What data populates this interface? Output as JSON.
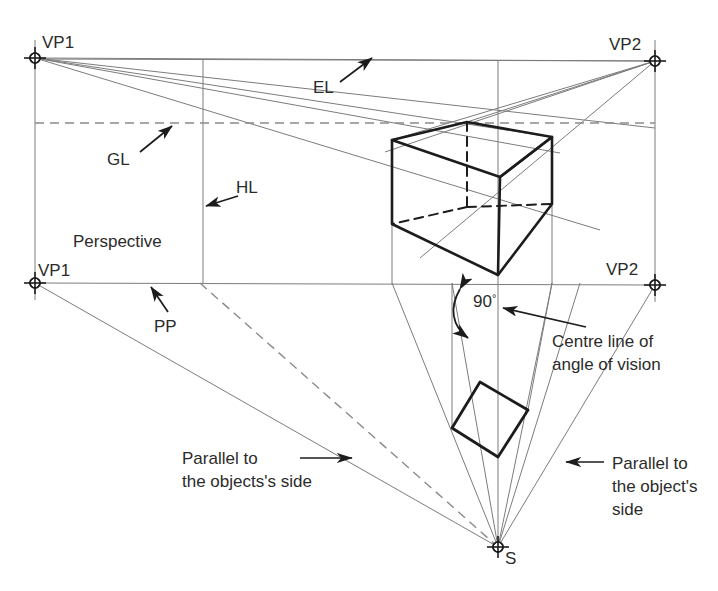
{
  "figure": {
    "colors": {
      "construction_line": "#7c7c7c",
      "object_line": "#1c1c1c",
      "dashed_line": "#8a8a8a",
      "text": "#2b2b2b",
      "background": "#ffffff"
    },
    "labels": {
      "vp1_top": "VP1",
      "vp2_top": "VP2",
      "vp1_bottom": "VP1",
      "vp2_bottom": "VP2",
      "el": "EL",
      "gl": "GL",
      "hl": "HL",
      "pp": "PP",
      "perspective": "Perspective",
      "angle_value": "90",
      "angle_degree_symbol": "°",
      "station_point": "S",
      "centre_line_1": "Centre line of",
      "centre_line_2": "angle of vision",
      "parallel_left_1": "Parallel to",
      "parallel_left_2": "the objects's side",
      "parallel_right_1": "Parallel to",
      "parallel_right_2": "the object's",
      "parallel_right_3": "side"
    },
    "points": {
      "vp1_top": [
        35,
        58
      ],
      "vp2_top": [
        655,
        61
      ],
      "vp1_bottom": [
        35,
        283
      ],
      "vp2_bottom": [
        655,
        285
      ],
      "station_point": [
        498,
        547
      ]
    },
    "lines": {
      "eye_level_y": 60,
      "ground_level_y": 123,
      "picture_plane_y": 283,
      "horizon_vertical_x": 203,
      "centre_vertical_x": 498
    },
    "cube_vertices": {
      "top_back": [
        467,
        122
      ],
      "top_left": [
        392,
        140
      ],
      "top_right": [
        552,
        137
      ],
      "top_front": [
        500,
        177
      ],
      "bottom_left": [
        392,
        224
      ],
      "bottom_front": [
        498,
        275
      ],
      "bottom_right": [
        552,
        204
      ]
    },
    "plan_square_vertices": {
      "top": [
        480,
        382
      ],
      "right": [
        528,
        410
      ],
      "bottom": [
        498,
        457
      ],
      "left": [
        452,
        428
      ]
    }
  }
}
